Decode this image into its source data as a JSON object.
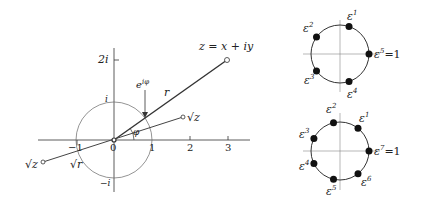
{
  "left_diagram": {
    "title_point": "z = x + iy",
    "labels": {
      "two_i": "2i",
      "i": "i",
      "neg_i": "−i",
      "exp": "e",
      "exp_sup": "iφ",
      "r": "r",
      "phi": "φ",
      "sqrt_z": "√z",
      "neg_sqrt_z": "√z",
      "sqrt_r": "√r",
      "zero": "0",
      "one": "1",
      "neg_one": "−1",
      "two": "2",
      "three": "3"
    }
  },
  "top_circle": {
    "n": 5,
    "labels": [
      {
        "base": "ε",
        "sup": "1"
      },
      {
        "base": "ε",
        "sup": "2"
      },
      {
        "base": "ε",
        "sup": "3"
      },
      {
        "base": "ε",
        "sup": "4"
      },
      {
        "base": "ε",
        "sup": "5",
        "suffix": "=1"
      }
    ]
  },
  "bottom_circle": {
    "n": 7,
    "labels": [
      {
        "base": "ε",
        "sup": "1"
      },
      {
        "base": "ε",
        "sup": "2"
      },
      {
        "base": "ε",
        "sup": "3"
      },
      {
        "base": "ε",
        "sup": "4"
      },
      {
        "base": "ε",
        "sup": "5"
      },
      {
        "base": "ε",
        "sup": "6"
      },
      {
        "base": "ε",
        "sup": "7",
        "suffix": "=1"
      }
    ]
  }
}
